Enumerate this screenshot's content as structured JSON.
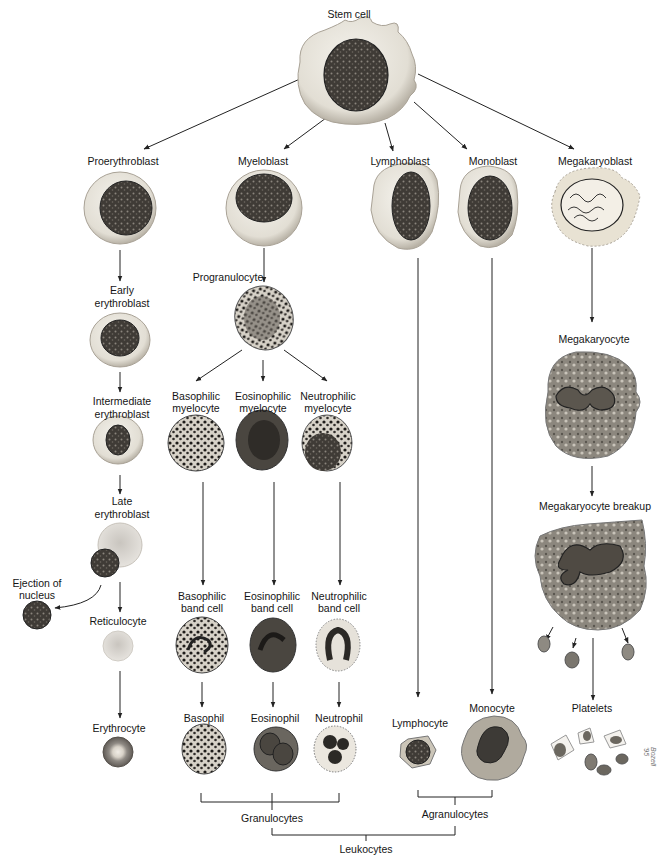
{
  "root": {
    "label": "Stem cell"
  },
  "lineages": {
    "erythroid": {
      "stages": [
        "Proerythroblast",
        "Early erythroblast",
        "Intermediate erythroblast",
        "Late erythroblast",
        "Reticulocyte",
        "Erythrocyte"
      ],
      "side_label": "Ejection of nucleus"
    },
    "granulocytic": {
      "blast": "Myeloblast",
      "progranulocyte": "Progranulocyte",
      "myelocytes": [
        "Basophilic myelocyte",
        "Eosinophilic myelocyte",
        "Neutrophilic myelocyte"
      ],
      "band_cells": [
        "Basophilic band cell",
        "Eosinophilic band cell",
        "Neutrophilic band cell"
      ],
      "mature": [
        "Basophil",
        "Eosinophil",
        "Neutrophil"
      ]
    },
    "lymphoid": {
      "blast": "Lymphoblast",
      "mature": "Lymphocyte"
    },
    "monocytic": {
      "blast": "Monoblast",
      "mature": "Monocyte"
    },
    "megakaryocytic": {
      "stages": [
        "Megakaryoblast",
        "Megakaryocyte",
        "Megakaryocyte breakup",
        "Platelets"
      ]
    }
  },
  "groupings": {
    "granulocytes": "Granulocytes",
    "agranulocytes": "Agranulocytes",
    "leukocytes": "Leukocytes"
  },
  "labels": {
    "stem_cell": "Stem cell",
    "proerythroblast": "Proerythroblast",
    "myeloblast": "Myeloblast",
    "lymphoblast": "Lymphoblast",
    "monoblast": "Monoblast",
    "megakaryoblast": "Megakaryoblast",
    "early_1": "Early",
    "early_2": "erythroblast",
    "progranulocyte": "Progranulocyte",
    "intermediate_1": "Intermediate",
    "intermediate_2": "erythroblast",
    "baso_my_1": "Basophilic",
    "baso_my_2": "myelocyte",
    "eos_my_1": "Eosinophilic",
    "eos_my_2": "myelocyte",
    "neu_my_1": "Neutrophilic",
    "neu_my_2": "myelocyte",
    "megakaryocyte": "Megakaryocyte",
    "late_1": "Late",
    "late_2": "erythroblast",
    "megakaryocyte_breakup": "Megakaryocyte breakup",
    "ejection_1": "Ejection of",
    "ejection_2": "nucleus",
    "baso_band_1": "Basophilic",
    "baso_band_2": "band cell",
    "eos_band_1": "Eosinophilic",
    "eos_band_2": "band cell",
    "neu_band_1": "Neutrophilic",
    "neu_band_2": "band cell",
    "reticulocyte": "Reticulocyte",
    "erythrocyte": "Erythrocyte",
    "basophil": "Basophil",
    "eosinophil": "Eosinophil",
    "neutrophil": "Neutrophil",
    "lymphocyte": "Lymphocyte",
    "monocyte": "Monocyte",
    "platelets": "Platelets",
    "granulocytes": "Granulocytes",
    "agranulocytes": "Agranulocytes",
    "leukocytes": "Leukocytes",
    "signature": "Bozell '95"
  },
  "colors": {
    "line": "#222222",
    "cytoplasm": "#e9e6df",
    "cytoplasm_edge": "#b9b4a8",
    "nucleus": "#3d3a36",
    "granule": "#1e1c1a",
    "erythrocyte": "#8f8a84"
  }
}
